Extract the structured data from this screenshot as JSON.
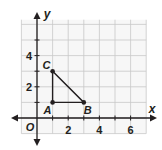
{
  "axes": {
    "x_label": "x",
    "y_label": "y",
    "origin_label": "O",
    "x_ticks": [
      {
        "v": 2,
        "label": "2"
      },
      {
        "v": 4,
        "label": "4"
      },
      {
        "v": 6,
        "label": "6"
      }
    ],
    "y_ticks": [
      {
        "v": 2,
        "label": "2"
      },
      {
        "v": 4,
        "label": "4"
      }
    ]
  },
  "triangle": {
    "points": [
      {
        "name": "A",
        "x": 1,
        "y": 1
      },
      {
        "name": "B",
        "x": 3,
        "y": 1
      },
      {
        "name": "C",
        "x": 1,
        "y": 3
      }
    ]
  },
  "colors": {
    "grid": "#c8c8c8",
    "axis": "#231f20",
    "shape": "#231f20",
    "background_grid": "#f7f7f7"
  }
}
